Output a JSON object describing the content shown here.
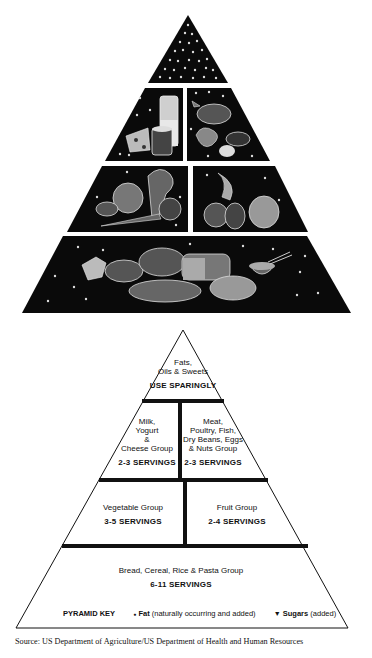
{
  "illustrated_pyramid": {
    "tiers": [
      {
        "id": "top",
        "content": "fats-oils-sweets-symbols"
      },
      {
        "id": "dairy",
        "content": "milk-glass-cheese-yogurt"
      },
      {
        "id": "meat",
        "content": "poultry-fish-beans-eggs-nuts"
      },
      {
        "id": "vegetable",
        "content": "cabbage-broccoli-carrot-tomato-potato"
      },
      {
        "id": "fruit",
        "content": "banana-apple-pepper-grapes"
      },
      {
        "id": "grains",
        "content": "bread-cereal-rice-pasta-crackers"
      }
    ]
  },
  "key_pyramid": {
    "tip": {
      "line1": "Fats,",
      "line2": "Oils & Sweets",
      "servings": "USE SPARINGLY"
    },
    "milk": {
      "line1": "Milk,",
      "line2": "Yogurt",
      "line3": "&",
      "line4": "Cheese Group",
      "servings": "2-3 SERVINGS"
    },
    "meat": {
      "line1": "Meat,",
      "line2": "Poultry, Fish,",
      "line3": "Dry Beans, Eggs",
      "line4": "& Nuts Group",
      "servings": "2-3 SERVINGS"
    },
    "vegetable": {
      "line1": "Vegetable Group",
      "servings": "3-5 SERVINGS"
    },
    "fruit": {
      "line1": "Fruit Group",
      "servings": "2-4 SERVINGS"
    },
    "grains": {
      "line1": "Bread, Cereal, Rice & Pasta Group",
      "servings": "6-11 SERVINGS"
    },
    "key": {
      "title": "PYRAMID KEY",
      "fat_symbol": "●",
      "fat_label": "Fat",
      "fat_note": "(naturally occurring and added)",
      "sugar_symbol": "▼",
      "sugar_label": "Sugars",
      "sugar_note": "(added)"
    }
  },
  "source": "Source: US Department of Agriculture/US Department of Health and Human Resources",
  "colors": {
    "fill": "#0a0a0a",
    "line": "#111111",
    "background": "#ffffff"
  }
}
